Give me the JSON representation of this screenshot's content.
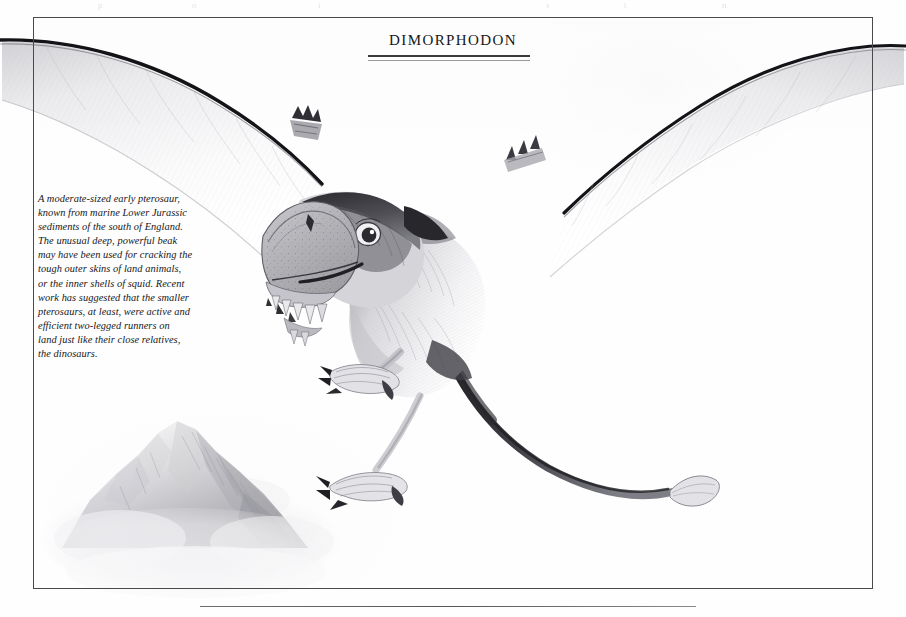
{
  "page": {
    "kind": "illustrated-book-plate",
    "width": 906,
    "height": 617,
    "background_color": "#fefefe",
    "ink_color": "#17171a"
  },
  "top_bleed": {
    "description": "faint ghosted show-through marks from the facing page along the very top edge",
    "marks": [
      {
        "text": "p",
        "x": 98
      },
      {
        "text": "o",
        "x": 192
      },
      {
        "text": "i",
        "x": 318
      },
      {
        "text": "s",
        "x": 546
      },
      {
        "text": "t",
        "x": 624
      },
      {
        "text": "n",
        "x": 722
      },
      {
        "text": "g",
        "x": 918
      }
    ]
  },
  "frame": {
    "name": "plate-border",
    "left": 33,
    "top": 17,
    "width": 840,
    "height": 572,
    "border_color": "#4a4a4a",
    "border_width": 1
  },
  "title": {
    "text": "Dimorphodon",
    "style": "small-caps serif",
    "color": "#161616",
    "rules": [
      {
        "name": "upper-rule",
        "color": "#3a3a3a",
        "thickness": 1.6
      },
      {
        "name": "lower-rule",
        "color": "#9a9a9a",
        "thickness": 1.1
      }
    ]
  },
  "caption": {
    "style": "italic serif",
    "color": "#17171a",
    "lines": [
      "A moderate-sized early pterosaur,",
      "known from marine Lower Jurassic",
      "sediments of the south of England.",
      "The unusual deep, powerful beak",
      "may have been used for cracking the",
      "tough outer skins of land animals,",
      "or the inner shells of squid. Recent",
      "work has suggested that the smaller",
      "pterosaurs, at least, were active and",
      "efficient two-legged runners on",
      "land just like their close relatives,",
      "the dinosaurs."
    ],
    "full_text": "A moderate-sized early pterosaur, known from marine Lower Jurassic sediments of the south of England. The unusual deep, powerful beak may have been used for cracking the tough outer skins of land animals, or the inner shells of squid. Recent work has suggested that the smaller pterosaurs, at least, were active and efficient two-legged runners on land just like their close relatives, the dinosaurs."
  },
  "artwork": {
    "subject": "Dimorphodon pterosaur in flight, pencil illustration",
    "medium": "graphite pencil drawing",
    "elements": [
      {
        "name": "left-wing",
        "note": "long tapering membrane, dark leading edge, extends past left frame border"
      },
      {
        "name": "right-wing",
        "note": "long tapering membrane, dark leading edge, extends past right frame border"
      },
      {
        "name": "head",
        "note": "deep puffin-like beak, speckled texture, dark eye mask, pale iris with dark pupil"
      },
      {
        "name": "teeth",
        "note": "row of pointed teeth in lower jaw"
      },
      {
        "name": "body",
        "note": "furred torso, soft hatching"
      },
      {
        "name": "left-foot",
        "note": "three dark claws, scaly toes"
      },
      {
        "name": "right-foot",
        "note": "three dark claws, scaly toes"
      },
      {
        "name": "tail",
        "note": "long dark tapering tail ending in a diamond-shaped vane"
      },
      {
        "name": "wing-finger-claws",
        "note": "small claws at the wrist of each wing"
      },
      {
        "name": "rocky-peak",
        "note": "misty rock outcrop rising from cloud in lower left"
      },
      {
        "name": "cloud-bank",
        "note": "soft pale mist across the lower left"
      }
    ],
    "palette": {
      "ink_dark": "#1a1a1a",
      "mid_grey": "#8e8e92",
      "light_grey": "#c8c8cc",
      "membrane_pale": "#f2f2f4",
      "beak_tone": "#b9b9bd"
    }
  },
  "footer": {
    "rule": {
      "name": "footer-rule",
      "left": 200,
      "width": 496,
      "color": "#6e6e6e"
    }
  }
}
